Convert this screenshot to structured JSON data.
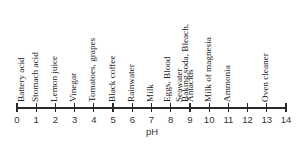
{
  "diagram": {
    "type": "ph-scale",
    "axis": {
      "title": "pH",
      "min": 0,
      "max": 14,
      "ticks": [
        "0",
        "1",
        "2",
        "3",
        "4",
        "5",
        "6",
        "7",
        "8",
        "9",
        "10",
        "11",
        "12",
        "13",
        "14"
      ]
    },
    "substances": [
      {
        "label": "Battery acid",
        "ph": 0.3
      },
      {
        "label": "Stomach acid",
        "ph": 1.0
      },
      {
        "label": "Lemon juice",
        "ph": 2.0
      },
      {
        "label": "Vinegar",
        "ph": 3.0
      },
      {
        "label": "Tomatoes, grapes",
        "ph": 4.0
      },
      {
        "label": "Black coffee",
        "ph": 5.0
      },
      {
        "label": "Rainwater",
        "ph": 6.0
      },
      {
        "label": "Milk",
        "ph": 7.0
      },
      {
        "label": "Eggs, Blood",
        "ph": 7.9
      },
      {
        "label": "Seawater",
        "ph": 8.5
      },
      {
        "label": "Baking soda, Bleach,",
        "ph": 8.8
      },
      {
        "label": "Antacids",
        "ph": 9.1
      },
      {
        "label": "Milk of magnesia",
        "ph": 10.0
      },
      {
        "label": "Ammonia",
        "ph": 11.0
      },
      {
        "label": "Oven cleaner",
        "ph": 13.0
      }
    ]
  }
}
